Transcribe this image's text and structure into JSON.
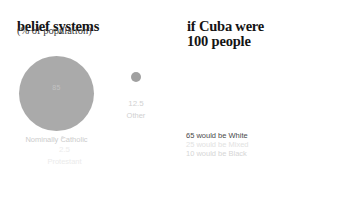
{
  "left": {
    "title": "belief systems",
    "subtitle": "(% of population)",
    "items": [
      {
        "label": "Nominally Catholic",
        "value": "85"
      },
      {
        "label": "Other",
        "value": "12.5"
      },
      {
        "label": "Protestant",
        "value": "2.5"
      }
    ]
  },
  "right": {
    "title": "if Cuba were\n100 people",
    "legend": [
      {
        "text": "65 would be White",
        "color": "#8e8e8e"
      },
      {
        "text": "25 would be Mixed",
        "color": "#c9c9c9"
      },
      {
        "text": "10 would be Black",
        "color": "#dcdcdc"
      }
    ]
  },
  "chart_data": [
    {
      "type": "pie",
      "title": "belief systems",
      "subtitle": "(% of population)",
      "unit": "% of population",
      "categories": [
        "Nominally Catholic",
        "Other",
        "Protestant"
      ],
      "values": [
        85,
        12.5,
        2.5
      ],
      "colors": [
        "#aaaaaa",
        "#a0a0a0",
        "#e2e2e2"
      ],
      "legend": "labels-below-bubbles",
      "grid": false,
      "note": "bubble/proportional-circle chart; area scaled to percentage"
    },
    {
      "type": "bar",
      "title": "if Cuba were 100 people",
      "xlabel": "",
      "ylabel": "people (out of 100)",
      "categories": [
        "White",
        "Mixed",
        "Black"
      ],
      "values": [
        65,
        25,
        10
      ],
      "colors": [
        "#8e8e8e",
        "#c9c9c9",
        "#dcdcdc"
      ],
      "ylim": [
        0,
        100
      ],
      "grid": false,
      "legend": "below",
      "note": "pictogram / isotype chart: 100 person icons arranged in 5 rows of 20",
      "pictogram": {
        "total": 100,
        "rows": 5,
        "columns": 20,
        "icon": "person"
      }
    }
  ]
}
